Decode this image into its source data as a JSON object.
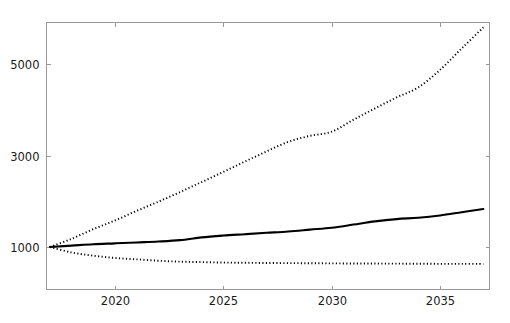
{
  "chart_data": {
    "type": "line",
    "title": "",
    "subtitle": "",
    "xlabel": "",
    "ylabel": "",
    "xlim": [
      2017,
      2037
    ],
    "ylim": [
      460,
      6100
    ],
    "grid": false,
    "legend_position": "none",
    "x_ticks": [
      2020,
      2025,
      2030,
      2035
    ],
    "x_tick_labels": [
      "2020",
      "2025",
      "2030",
      "2035"
    ],
    "y_ticks": [
      1000,
      3000,
      5000
    ],
    "y_tick_labels": [
      "1000",
      "3000",
      "5000"
    ],
    "x": [
      2017,
      2018,
      2019,
      2020,
      2021,
      2022,
      2023,
      2024,
      2025,
      2026,
      2027,
      2028,
      2029,
      2030,
      2031,
      2032,
      2033,
      2034,
      2035,
      2036,
      2037
    ],
    "series": [
      {
        "name": "high-projection",
        "style": "dotted",
        "color": "#000000",
        "values": [
          1000,
          1180,
          1390,
          1580,
          1790,
          1990,
          2200,
          2420,
          2640,
          2870,
          3090,
          3300,
          3430,
          3520,
          3780,
          4030,
          4270,
          4490,
          4870,
          5340,
          5800
        ]
      },
      {
        "name": "medium-projection",
        "style": "solid",
        "color": "#000000",
        "values": [
          1000,
          1030,
          1060,
          1080,
          1100,
          1120,
          1150,
          1210,
          1250,
          1280,
          1310,
          1340,
          1380,
          1420,
          1490,
          1560,
          1610,
          1640,
          1690,
          1760,
          1830
        ]
      },
      {
        "name": "low-projection",
        "style": "dotted",
        "color": "#000000",
        "values": [
          1000,
          880,
          810,
          760,
          730,
          700,
          680,
          670,
          660,
          655,
          650,
          648,
          645,
          642,
          640,
          638,
          636,
          634,
          632,
          631,
          630
        ]
      }
    ]
  },
  "axes": {
    "frame_color": "#9a9a9a",
    "background": "#ffffff"
  }
}
